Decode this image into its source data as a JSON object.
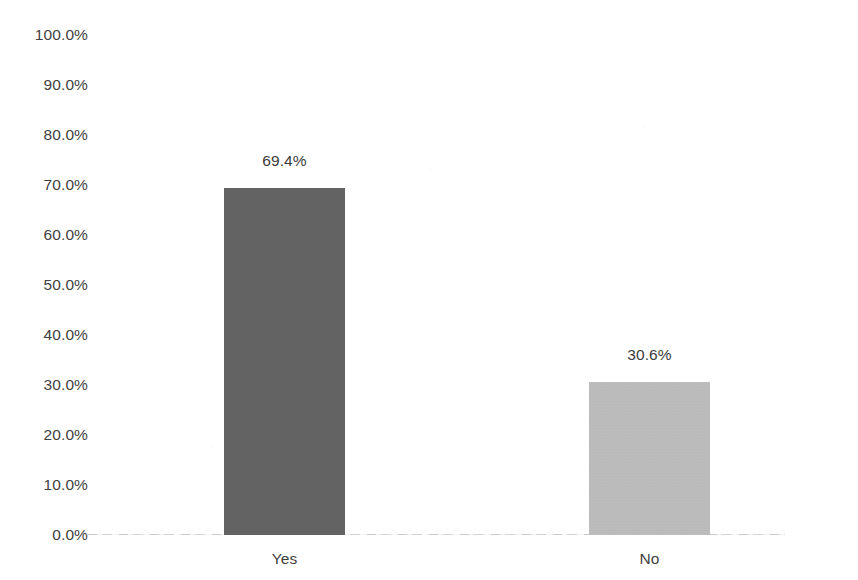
{
  "chart_data": {
    "type": "bar",
    "title": "",
    "subtitle": "",
    "xlabel": "",
    "ylabel": "",
    "categories": [
      "Yes",
      "No"
    ],
    "values": [
      69.4,
      30.6
    ],
    "data_labels": [
      "69.4%",
      "30.6%"
    ],
    "bar_colors": [
      "#5f5f5f",
      "#c0c0c0"
    ],
    "ylim": [
      0,
      100
    ],
    "y_tick_values": [
      100,
      90,
      80,
      70,
      60,
      50,
      40,
      30,
      20,
      10,
      0
    ],
    "y_tick_labels": [
      "100.0%",
      "90.0%",
      "80.0%",
      "70.0%",
      "60.0%",
      "50.0%",
      "40.0%",
      "30.0%",
      "20.0%",
      "10.0%",
      "0.0%"
    ],
    "grid": false,
    "legend": "none",
    "axis_line_color": "#d2d2d2",
    "background_color": "#ffffff",
    "text_color": "#3f3f3f"
  }
}
